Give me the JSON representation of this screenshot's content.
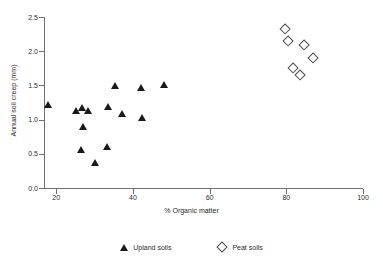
{
  "chart_data": {
    "type": "scatter",
    "title": "",
    "xlabel": "% Organic matter",
    "ylabel": "Annual soil creep (mm)",
    "xlim": [
      16.8,
      100
    ],
    "ylim": [
      0.0,
      2.5
    ],
    "xticks": [
      20,
      40,
      60,
      80,
      100
    ],
    "yticks": [
      "0.0",
      "0.5",
      "1.0",
      "1.5",
      "2.0",
      "2.5"
    ],
    "grid": false,
    "legend_position": "bottom",
    "series": [
      {
        "name": "Upland soils",
        "marker": "filled-triangle",
        "color": "#1a1a1a",
        "points": [
          {
            "x": 18.0,
            "y": 1.21
          },
          {
            "x": 25.2,
            "y": 1.13
          },
          {
            "x": 26.8,
            "y": 1.17
          },
          {
            "x": 28.4,
            "y": 1.13
          },
          {
            "x": 26.9,
            "y": 0.9
          },
          {
            "x": 26.6,
            "y": 0.55
          },
          {
            "x": 30.1,
            "y": 0.37
          },
          {
            "x": 33.2,
            "y": 0.6
          },
          {
            "x": 33.5,
            "y": 1.19
          },
          {
            "x": 35.3,
            "y": 1.49
          },
          {
            "x": 37.2,
            "y": 1.09
          },
          {
            "x": 42.2,
            "y": 1.46
          },
          {
            "x": 42.3,
            "y": 1.03
          },
          {
            "x": 48.2,
            "y": 1.51
          }
        ]
      },
      {
        "name": "Peat soils",
        "marker": "open-diamond",
        "color": "#4a4a4a",
        "points": [
          {
            "x": 79.8,
            "y": 2.32
          },
          {
            "x": 80.5,
            "y": 2.15
          },
          {
            "x": 84.6,
            "y": 2.09
          },
          {
            "x": 87.0,
            "y": 1.9
          },
          {
            "x": 81.8,
            "y": 1.75
          },
          {
            "x": 83.6,
            "y": 1.65
          }
        ]
      }
    ]
  },
  "legend": {
    "entries": [
      {
        "label": "Upland soils",
        "marker": "filled-triangle"
      },
      {
        "label": "Peat soils",
        "marker": "open-diamond"
      }
    ]
  },
  "icons": {
    "upland_marker": "filled-triangle-icon",
    "peat_marker": "open-diamond-icon"
  }
}
